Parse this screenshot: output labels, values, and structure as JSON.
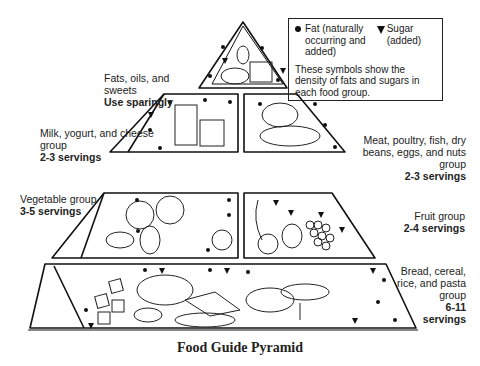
{
  "legend": {
    "fat_label": "Fat (naturally occurring and added)",
    "sugar_label": "Sugar (added)",
    "note": "These symbols show the density of fats and sugars in each food group.",
    "fat_icon": "filled-circle",
    "sugar_icon": "filled-down-triangle"
  },
  "tiers": [
    {
      "name": "Fats, oils, and sweets",
      "servings": "Use sparingly",
      "illustration": "sugar bowl, oil bottle, shortening can"
    },
    {
      "name": "Milk, yogurt, and cheese group",
      "servings": "2-3 servings",
      "illustration": "milk glass, yogurt cup, cheese"
    },
    {
      "name": "Meat, poultry, fish, dry beans, eggs, and nuts group",
      "servings": "2-3 servings",
      "illustration": "chicken, fish, eggs, beans"
    },
    {
      "name": "Vegetable group",
      "servings": "3-5 servings",
      "illustration": "broccoli, cabbage, potatoes, carrots, tomato"
    },
    {
      "name": "Fruit group",
      "servings": "2-4 servings",
      "illustration": "banana, orange, apple, grapes"
    },
    {
      "name": "Bread, cereal, rice, and pasta group",
      "servings": "6-11 servings",
      "illustration": "crackers, bread, cereal bowl, spaghetti, rice"
    }
  ],
  "labels": {
    "fats_name": "Fats, oils, and sweets",
    "fats_serv": "Use sparingly",
    "milk_name": "Milk, yogurt, and cheese group",
    "milk_serv": "2-3 servings",
    "meat_name": "Meat, poultry, fish, dry beans, eggs, and nuts group",
    "meat_serv": "2-3 servings",
    "veg_name": "Vegetable group",
    "veg_serv": "3-5 servings",
    "fruit_name": "Fruit group",
    "fruit_serv": "2-4 servings",
    "bread_name": "Bread, cereal, rice, and pasta group",
    "bread_serv_1": "6-11",
    "bread_serv_2": "servings"
  },
  "caption": "Food Guide Pyramid",
  "colors": {
    "ink": "#1a1a1a",
    "background": "#ffffff"
  }
}
